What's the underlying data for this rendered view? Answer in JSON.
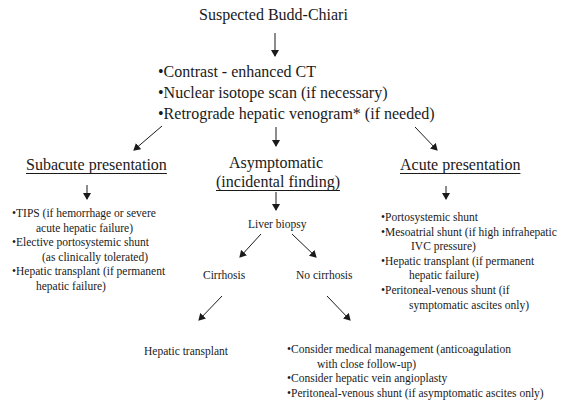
{
  "title": "Suspected Budd-Chiari",
  "workup": {
    "items": [
      "•Contrast - enhanced CT",
      "•Nuclear isotope scan (if necessary)",
      "•Retrograde hepatic venogram* (if needed)"
    ]
  },
  "subacute": {
    "heading": "Subacute presentation",
    "items": [
      {
        "line1": "•TIPS (if hemorrhage or severe",
        "line2": "acute hepatic failure)"
      },
      {
        "line1": "•Elective portosystemic shunt",
        "line2": "(as clinically tolerated)"
      },
      {
        "line1": "•Hepatic transplant (if permanent",
        "line2": "hepatic failure)"
      }
    ]
  },
  "asymptomatic": {
    "heading_line1": "Asymptomatic",
    "heading_line2": "(incidental finding)",
    "biopsy": "Liver biopsy",
    "cirrhosis": {
      "label": "Cirrhosis",
      "outcome": "Hepatic transplant"
    },
    "no_cirrhosis": {
      "label": "No cirrhosis",
      "items": [
        {
          "line1": "•Consider medical management (anticoagulation",
          "line2": "with close follow-up)"
        },
        {
          "line1": "•Consider hepatic vein angioplasty",
          "line2": ""
        },
        {
          "line1": "•Peritoneal-venous shunt (if asymptomatic ascites only)",
          "line2": ""
        }
      ]
    }
  },
  "acute": {
    "heading": "Acute presentation",
    "items": [
      {
        "line1": "•Portosystemic shunt",
        "line2": ""
      },
      {
        "line1": "•Mesoatrial shunt (if high infrahepatic",
        "line2": "IVC pressure)"
      },
      {
        "line1": "•Hepatic transplant (if permanent",
        "line2": "hepatic failure)"
      },
      {
        "line1": "•Peritoneal-venous shunt (if",
        "line2": "symptomatic ascites only)"
      }
    ]
  }
}
